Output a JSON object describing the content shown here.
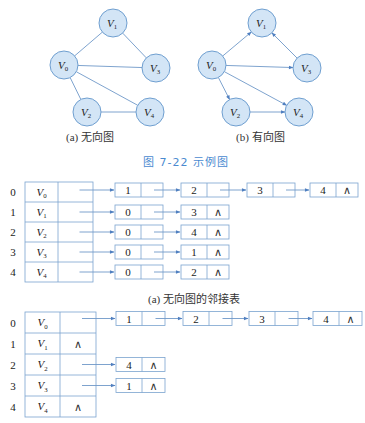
{
  "colors": {
    "node_fill": "#d3e5f6",
    "node_stroke": "#6f9fd0",
    "edge": "#6f98c8",
    "box_stroke": "#7ba3cf",
    "caption_accent": "#4a8ad0"
  },
  "figure": {
    "undirected_caption": "(a) 无向图",
    "directed_caption": "(b) 有向图",
    "figure_caption": "图 7-22   示例图",
    "adjlist_a_caption": "(a) 无向图的邻接表"
  },
  "undirected_graph": {
    "nodes": [
      {
        "id": "V0",
        "label": "V",
        "sub": "0",
        "x": 64,
        "y": 65
      },
      {
        "id": "V1",
        "label": "V",
        "sub": "1",
        "x": 113,
        "y": 23
      },
      {
        "id": "V2",
        "label": "V",
        "sub": "2",
        "x": 87,
        "y": 112
      },
      {
        "id": "V3",
        "label": "V",
        "sub": "3",
        "x": 156,
        "y": 68
      },
      {
        "id": "V4",
        "label": "V",
        "sub": "4",
        "x": 150,
        "y": 112
      }
    ],
    "edges": [
      [
        "V0",
        "V1"
      ],
      [
        "V1",
        "V3"
      ],
      [
        "V0",
        "V3"
      ],
      [
        "V0",
        "V2"
      ],
      [
        "V0",
        "V4"
      ],
      [
        "V2",
        "V4"
      ]
    ]
  },
  "directed_graph": {
    "nodes": [
      {
        "id": "V0",
        "label": "V",
        "sub": "0",
        "x": 212,
        "y": 65
      },
      {
        "id": "V1",
        "label": "V",
        "sub": "1",
        "x": 262,
        "y": 23
      },
      {
        "id": "V2",
        "label": "V",
        "sub": "2",
        "x": 236,
        "y": 112
      },
      {
        "id": "V3",
        "label": "V",
        "sub": "3",
        "x": 307,
        "y": 68
      },
      {
        "id": "V4",
        "label": "V",
        "sub": "4",
        "x": 299,
        "y": 112
      }
    ],
    "edges": [
      [
        "V0",
        "V1"
      ],
      [
        "V3",
        "V1"
      ],
      [
        "V0",
        "V3"
      ],
      [
        "V0",
        "V2"
      ],
      [
        "V0",
        "V4"
      ],
      [
        "V2",
        "V4"
      ]
    ]
  },
  "adjacency_list_undirected": {
    "rows": [
      {
        "index": "0",
        "vertex": "V",
        "sub": "0",
        "neighbors": [
          "1",
          "2",
          "3",
          "4"
        ]
      },
      {
        "index": "1",
        "vertex": "V",
        "sub": "1",
        "neighbors": [
          "0",
          "3"
        ]
      },
      {
        "index": "2",
        "vertex": "V",
        "sub": "2",
        "neighbors": [
          "0",
          "4"
        ]
      },
      {
        "index": "3",
        "vertex": "V",
        "sub": "3",
        "neighbors": [
          "0",
          "1"
        ]
      },
      {
        "index": "4",
        "vertex": "V",
        "sub": "4",
        "neighbors": [
          "0",
          "2"
        ]
      }
    ],
    "null_symbol": "∧"
  },
  "adjacency_list_directed": {
    "rows": [
      {
        "index": "0",
        "vertex": "V",
        "sub": "0",
        "neighbors": [
          "1",
          "2",
          "3",
          "4"
        ]
      },
      {
        "index": "1",
        "vertex": "V",
        "sub": "1",
        "neighbors": []
      },
      {
        "index": "2",
        "vertex": "V",
        "sub": "2",
        "neighbors": [
          "4"
        ]
      },
      {
        "index": "3",
        "vertex": "V",
        "sub": "3",
        "neighbors": [
          "1"
        ]
      },
      {
        "index": "4",
        "vertex": "V",
        "sub": "4",
        "neighbors": []
      }
    ],
    "null_symbol": "∧"
  }
}
